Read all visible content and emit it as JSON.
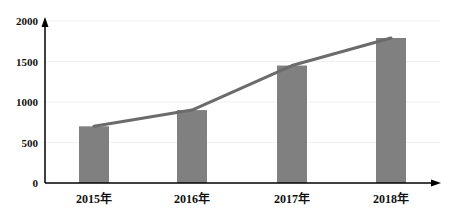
{
  "chart_data": {
    "type": "bar+line",
    "title": "",
    "xlabel": "",
    "ylabel": "",
    "categories": [
      "2015年",
      "2016年",
      "2017年",
      "2018年"
    ],
    "series": [
      {
        "name": "bar",
        "type": "bar",
        "values": [
          700,
          900,
          1450,
          1790
        ],
        "color": "#7f7f7f"
      },
      {
        "name": "line",
        "type": "line",
        "values": [
          700,
          900,
          1450,
          1790
        ],
        "color": "#6d6d6d"
      }
    ],
    "ylim": [
      0,
      2000
    ],
    "yticks": [
      0,
      500,
      1000,
      1500,
      2000
    ],
    "ytick_labels": [
      "0",
      "500",
      "1000",
      "1500",
      "2000"
    ],
    "grid": true,
    "legend": null
  },
  "colors": {
    "bar": "#808080",
    "line": "#6b6b6b",
    "axis": "#000000",
    "grid": "#f0f0f0"
  }
}
